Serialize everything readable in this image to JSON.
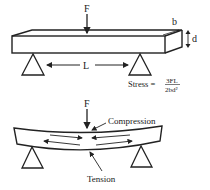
{
  "diagram": {
    "top": {
      "force_label": "F",
      "width_label": "b",
      "depth_label": "d",
      "span_label": "L",
      "stress_prefix": "Stress =",
      "stress_numerator": "3FL",
      "stress_denominator": "2bd²"
    },
    "bottom": {
      "force_label": "F",
      "compression_label": "Compression",
      "tension_label": "Tension"
    }
  }
}
